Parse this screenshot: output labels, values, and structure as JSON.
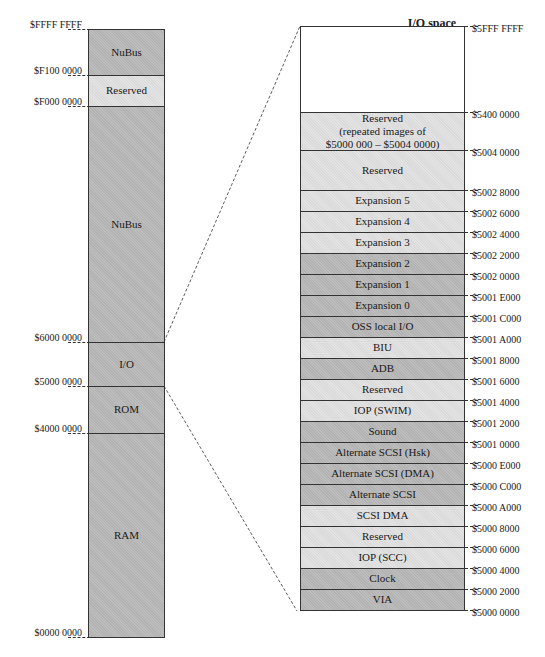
{
  "main_map": {
    "regions": [
      {
        "label": "NuBus",
        "shade": "dark"
      },
      {
        "label": "Reserved",
        "shade": "light"
      },
      {
        "label": "NuBus",
        "shade": "dark"
      },
      {
        "label": "I/O",
        "shade": "dark"
      },
      {
        "label": "ROM",
        "shade": "dark"
      },
      {
        "label": "RAM",
        "shade": "dark"
      }
    ],
    "addresses": [
      "$FFFF FFFF",
      "$F100 0000",
      "$F000 0000",
      "$6000 0000",
      "$5000 0000",
      "$4000 0000",
      "$0000 0000"
    ]
  },
  "io_space": {
    "title": "I/O space",
    "regions": [
      {
        "label": "",
        "shade": "white"
      },
      {
        "label": "Reserved\n(repeated images of\n$5000 000 – $5004 0000)",
        "shade": "light"
      },
      {
        "label": "Reserved",
        "shade": "light"
      },
      {
        "label": "Expansion 5",
        "shade": "light"
      },
      {
        "label": "Expansion 4",
        "shade": "light"
      },
      {
        "label": "Expansion 3",
        "shade": "light"
      },
      {
        "label": "Expansion 2",
        "shade": "dark"
      },
      {
        "label": "Expansion 1",
        "shade": "dark"
      },
      {
        "label": "Expansion 0",
        "shade": "dark"
      },
      {
        "label": "OSS local I/O",
        "shade": "dark"
      },
      {
        "label": "BIU",
        "shade": "light"
      },
      {
        "label": "ADB",
        "shade": "dark"
      },
      {
        "label": "Reserved",
        "shade": "light"
      },
      {
        "label": "IOP (SWIM)",
        "shade": "light"
      },
      {
        "label": "Sound",
        "shade": "dark"
      },
      {
        "label": "Alternate SCSI (Hsk)",
        "shade": "dark"
      },
      {
        "label": "Alternate SCSI (DMA)",
        "shade": "dark"
      },
      {
        "label": "Alternate SCSI",
        "shade": "dark"
      },
      {
        "label": "SCSI DMA",
        "shade": "light"
      },
      {
        "label": "Reserved",
        "shade": "light"
      },
      {
        "label": "IOP (SCC)",
        "shade": "light"
      },
      {
        "label": "Clock",
        "shade": "dark"
      },
      {
        "label": "VIA",
        "shade": "dark"
      }
    ],
    "addresses": [
      "$5FFF FFFF",
      "$5400 0000",
      "$5004 0000",
      "$5002 8000",
      "$5002 6000",
      "$5002 4000",
      "$5002 2000",
      "$5002 0000",
      "$5001 E000",
      "$5001 C000",
      "$5001 A000",
      "$5001 8000",
      "$5001 6000",
      "$5001 4000",
      "$5001 2000",
      "$5001 0000",
      "$5000 E000",
      "$5000 C000",
      "$5000 A000",
      "$5000 8000",
      "$5000 6000",
      "$5000 4000",
      "$5000 2000",
      "$5000 0000"
    ]
  }
}
